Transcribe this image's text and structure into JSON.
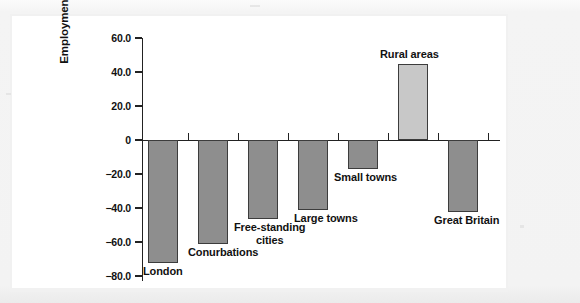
{
  "figure": {
    "background_color": "#f1f1f1",
    "panel_color": "#ffffff",
    "axis_color": "#222222"
  },
  "axis": {
    "y_title": "Employment change (%)",
    "y_ticks": [
      "60.0",
      "40.0",
      "20.0",
      "0",
      "-20.0",
      "-40.0",
      "-60.0",
      "-80.0"
    ]
  },
  "bars": [
    {
      "label": "London",
      "value": -72.5,
      "color": "#8e8e8e"
    },
    {
      "label": "Conurbations",
      "value": -61.0,
      "color": "#8e8e8e"
    },
    {
      "label": "Free-standing\ncities",
      "value": -46.5,
      "color": "#8e8e8e"
    },
    {
      "label": "Large towns",
      "value": -41.0,
      "color": "#8e8e8e"
    },
    {
      "label": "Small towns",
      "value": -17.0,
      "color": "#8e8e8e"
    },
    {
      "label": "Rural areas",
      "value": 45.0,
      "color": "#c8c8c8"
    },
    {
      "label": "Great Britain",
      "value": -42.5,
      "color": "#8e8e8e"
    }
  ],
  "chart_data": {
    "type": "bar",
    "title": "",
    "subtitle": "",
    "xlabel": "",
    "ylabel": "Employment change (%)",
    "categories": [
      "London",
      "Conurbations",
      "Free-standing cities",
      "Large towns",
      "Small towns",
      "Rural areas",
      "Great Britain"
    ],
    "values": [
      -72.5,
      -61.0,
      -46.5,
      -41.0,
      -17.0,
      45.0,
      -42.5
    ],
    "ylim": [
      -80.0,
      60.0
    ],
    "yticks": [
      60.0,
      40.0,
      20.0,
      0,
      -20.0,
      -40.0,
      -60.0,
      -80.0
    ],
    "ytick_labels": [
      "60.0",
      "40.0",
      "20.0",
      "0",
      "-20.0",
      "-40.0",
      "-60.0",
      "-80.0"
    ],
    "grid": false,
    "legend": false,
    "bar_colors": [
      "#8e8e8e",
      "#8e8e8e",
      "#8e8e8e",
      "#8e8e8e",
      "#8e8e8e",
      "#c8c8c8",
      "#8e8e8e"
    ],
    "annotations": [
      {
        "text": "London",
        "attached_to": "London",
        "position": "below-bar-end"
      },
      {
        "text": "Conurbations",
        "attached_to": "Conurbations",
        "position": "below-bar-end"
      },
      {
        "text": "Free-standing cities",
        "attached_to": "Free-standing cities",
        "position": "below-bar-end"
      },
      {
        "text": "Large towns",
        "attached_to": "Large towns",
        "position": "below-bar-end"
      },
      {
        "text": "Small towns",
        "attached_to": "Small towns",
        "position": "below-bar-end"
      },
      {
        "text": "Rural areas",
        "attached_to": "Rural areas",
        "position": "above-bar-end"
      },
      {
        "text": "Great Britain",
        "attached_to": "Great Britain",
        "position": "below-bar-end"
      }
    ]
  }
}
